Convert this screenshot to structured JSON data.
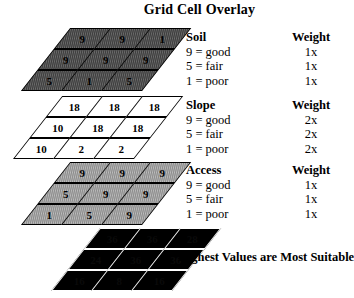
{
  "title": "Grid Cell Overlay",
  "caption": "Highest Values are Most Suitable",
  "layers": [
    {
      "id": "soil",
      "name": "Soil",
      "fill": "#6e6e6e",
      "values": [
        [
          9,
          9,
          1
        ],
        [
          9,
          9,
          9
        ],
        [
          5,
          1,
          5
        ]
      ]
    },
    {
      "id": "slope",
      "name": "Slope",
      "fill": "#ffffff",
      "values": [
        [
          18,
          18,
          18
        ],
        [
          10,
          18,
          18
        ],
        [
          10,
          2,
          2
        ]
      ]
    },
    {
      "id": "access",
      "name": "Access",
      "fill": "#bdbdbd",
      "values": [
        [
          9,
          9,
          9
        ],
        [
          5,
          9,
          9
        ],
        [
          1,
          5,
          9
        ]
      ]
    },
    {
      "id": "result",
      "name": "Result",
      "fill": "#000000",
      "values": [
        [
          36,
          36,
          28
        ],
        [
          24,
          36,
          36
        ],
        [
          16,
          8,
          16
        ]
      ]
    }
  ],
  "legends": [
    {
      "id": "soil",
      "header": {
        "criterion": "Soil",
        "weight": "Weight"
      },
      "rows": [
        {
          "label": "9 = good",
          "weight": "1x"
        },
        {
          "label": "5 = fair",
          "weight": "1x"
        },
        {
          "label": "1 = poor",
          "weight": "1x"
        }
      ]
    },
    {
      "id": "slope",
      "header": {
        "criterion": "Slope",
        "weight": "Weight"
      },
      "rows": [
        {
          "label": "9 = good",
          "weight": "2x"
        },
        {
          "label": "5 = fair",
          "weight": "2x"
        },
        {
          "label": "1 = poor",
          "weight": "2x"
        }
      ]
    },
    {
      "id": "access",
      "header": {
        "criterion": "Access",
        "weight": "Weight"
      },
      "rows": [
        {
          "label": "9 = good",
          "weight": "1x"
        },
        {
          "label": "5 = fair",
          "weight": "1x"
        },
        {
          "label": "1 = poor",
          "weight": "1x"
        }
      ]
    }
  ]
}
